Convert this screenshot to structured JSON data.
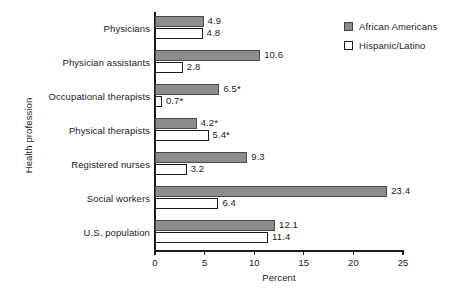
{
  "chart_data": {
    "type": "bar",
    "orientation": "horizontal",
    "title": "",
    "xlabel": "Percent",
    "ylabel": "Health profession",
    "xlim": [
      0,
      25
    ],
    "xticks": [
      0,
      5,
      10,
      15,
      20,
      25
    ],
    "xtick_labels": [
      "0",
      "5",
      "10",
      "15",
      "20",
      "25"
    ],
    "grid": false,
    "legend_position": "top-right",
    "categories": [
      "Physicians",
      "Physician assistants",
      "Occupational therapists",
      "Physical therapists",
      "Registered nurses",
      "Social workers",
      "U.S. population"
    ],
    "series": [
      {
        "name": "African Americans",
        "color": "#8c8c8c",
        "values": [
          4.9,
          10.6,
          6.5,
          4.2,
          9.3,
          23.4,
          12.1
        ],
        "labels": [
          "4.9",
          "10.6",
          "6.5*",
          "4.2*",
          "9.3",
          "23.4",
          "12.1"
        ]
      },
      {
        "name": "Hispanic/Latino",
        "color": "#ffffff",
        "values": [
          4.8,
          2.8,
          0.7,
          5.4,
          3.2,
          6.4,
          11.4
        ],
        "labels": [
          "4.8",
          "2.8",
          "0.7*",
          "5.4*",
          "3.2",
          "6.4",
          "11.4"
        ]
      }
    ]
  },
  "legend": {
    "items": [
      {
        "label": "African Americans"
      },
      {
        "label": "Hispanic/Latino"
      }
    ]
  }
}
